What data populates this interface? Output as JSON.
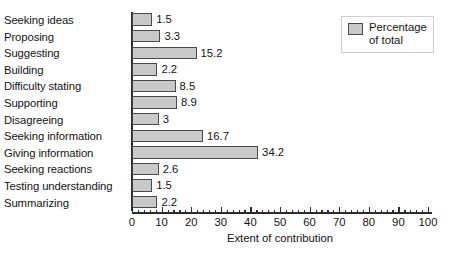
{
  "chart_data": {
    "type": "bar",
    "orientation": "horizontal",
    "title": "",
    "xlabel": "Extent of contribution",
    "ylabel": "",
    "xlim": [
      0,
      100
    ],
    "xticks": [
      0,
      10,
      20,
      30,
      40,
      50,
      60,
      70,
      80,
      90,
      100
    ],
    "minor_tick_step": 2,
    "grid": false,
    "legend": {
      "position": "top-right",
      "entries": [
        {
          "label_line1": "Percentage",
          "label_line2": "of total",
          "color": "#c9c9c9"
        }
      ]
    },
    "series": [
      {
        "name": "Percentage of total",
        "color": "#c9c9c9",
        "categories": [
          "Seeking ideas",
          "Proposing",
          "Suggesting",
          "Building",
          "Difficulty stating",
          "Supporting",
          "Disagreeing",
          "Seeking information",
          "Giving information",
          "Seeking reactions",
          "Testing understanding",
          "Summarizing"
        ],
        "values": [
          1.5,
          3.3,
          15.2,
          2.2,
          8.5,
          8.9,
          3,
          16.7,
          34.2,
          2.6,
          1.5,
          2.2
        ],
        "value_labels": [
          "1.5",
          "3.3",
          "15.2",
          "2.2",
          "8.5",
          "8.9",
          "3",
          "16.7",
          "34.2",
          "2.6",
          "1.5",
          "2.2"
        ],
        "drawn_lengths": [
          6.8,
          9.6,
          21.8,
          8.6,
          14.7,
          15.2,
          9.0,
          24.0,
          42.6,
          9.0,
          6.8,
          8.6
        ]
      }
    ]
  },
  "axis": {
    "tick_labels": [
      "0",
      "10",
      "20",
      "30",
      "40",
      "50",
      "60",
      "70",
      "80",
      "90",
      "100"
    ],
    "title": "Extent of contribution"
  },
  "legend": {
    "line1": "Percentage",
    "line2": "of total"
  },
  "colors": {
    "bar_fill": "#c9c9c9",
    "bar_stroke": "#4a4a4a",
    "axis": "#2b2b2b",
    "text": "#141414"
  }
}
